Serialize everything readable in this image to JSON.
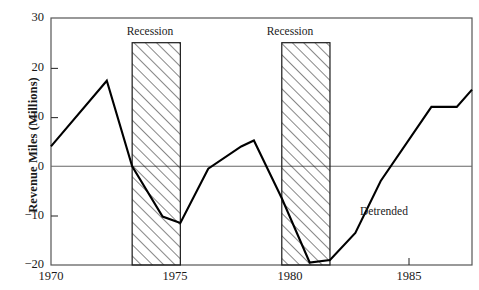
{
  "chart_data": {
    "type": "line",
    "title": "",
    "subtitle": "",
    "xlabel": "",
    "ylabel": "Revenue Miles (Millions)",
    "xlim": [
      1970,
      1986.6
    ],
    "ylim": [
      -20,
      30
    ],
    "grid": false,
    "legend_position": "inline-annotation",
    "y_ticks": [
      30,
      20,
      10,
      0,
      -10,
      -20
    ],
    "y_tick_labels": [
      "30",
      "20",
      "10",
      "0",
      "−10",
      "−20"
    ],
    "x_ticks": [
      1970,
      1975,
      1980,
      1985
    ],
    "x_tick_labels": [
      "1970",
      "1975",
      "1980",
      "1985"
    ],
    "zero_line": 0,
    "annotations": [
      {
        "id": "series-name",
        "text": "Detrended",
        "x": 1984.0,
        "y": -8.5
      },
      {
        "id": "recession-label-1",
        "text": "Recession",
        "x": 1973.2,
        "y": 28.0
      },
      {
        "id": "recession-label-2",
        "text": "Recession",
        "x": 1979.1,
        "y": 28.0
      }
    ],
    "shaded_regions": [
      {
        "label": "Recession",
        "x_start": 1973.2,
        "x_end": 1975.1,
        "y_top": 25,
        "y_bottom": -20,
        "pattern": "diagonal-hatch"
      },
      {
        "label": "Recession",
        "x_start": 1979.1,
        "x_end": 1981.0,
        "y_top": 25,
        "y_bottom": -20,
        "pattern": "diagonal-hatch"
      }
    ],
    "series": [
      {
        "name": "Detrended",
        "color": "#000000",
        "x": [
          1970.0,
          1972.2,
          1973.2,
          1974.4,
          1975.1,
          1976.2,
          1977.5,
          1978.0,
          1979.1,
          1980.2,
          1981.0,
          1982.0,
          1983.0,
          1985.0,
          1986.0,
          1986.6
        ],
        "values": [
          4.0,
          17.3,
          0.0,
          -10.2,
          -11.5,
          -0.5,
          4.0,
          5.2,
          -6.5,
          -19.5,
          -19.0,
          -13.5,
          -3.0,
          12.0,
          12.0,
          15.5
        ]
      }
    ]
  }
}
